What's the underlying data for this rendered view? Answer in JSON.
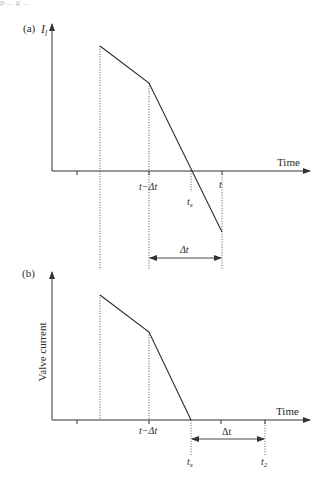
{
  "header": {
    "clipped_text": "p ... g ..."
  },
  "panel_a": {
    "label": "(a)",
    "y_axis_label": "I",
    "y_axis_subscript": "l",
    "x_axis_label": "Time",
    "tick_labels": {
      "t_minus_dt": "t−Δt",
      "tx": "t",
      "tx_sub": "x",
      "t": "t"
    },
    "interval_label": "Δt"
  },
  "panel_b": {
    "label": "(b)",
    "y_axis_label": "Valve current",
    "x_axis_label": "Time",
    "tick_labels": {
      "t_minus_dt": "t−Δt",
      "tx": "t",
      "tx_sub": "x",
      "t2": "t",
      "t2_sub": "2"
    },
    "interval_label": "Δt"
  },
  "colors": {
    "line": "#2a2a2a",
    "axis": "#333333",
    "background": "#ffffff"
  }
}
